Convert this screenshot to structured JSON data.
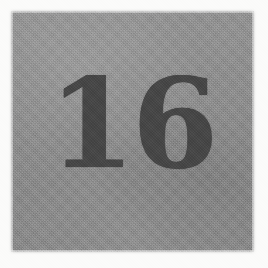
{
  "document": {
    "type": "scanned-page",
    "page_number_text": "16",
    "visible_text": "16"
  },
  "colors": {
    "paper_margin": "#fbfbfa",
    "tone_block": "#8f8f8f",
    "ink": "#4a4a4a"
  },
  "tone_block": {
    "name": "scanned-tone-area",
    "left_px": 13,
    "top_px": 13,
    "width_px": 239,
    "height_px": 237
  },
  "folio": {
    "label": "16",
    "left_px": 78,
    "top_px": 77,
    "width_px": 108,
    "height_px": 88
  }
}
